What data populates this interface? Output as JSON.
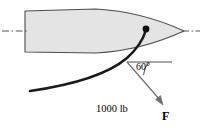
{
  "figure": {
    "name": "ship-bow-cable-force-diagram",
    "background_color": "#ffffff"
  },
  "hull": {
    "name": "ship-hull",
    "fill_color": "#e4e4e4",
    "stroke_color": "#4d4d4d",
    "path": "M 25 11 L 96 9 C 132 11 160 20 184 31 C 160 42 132 51 96 53 L 25 52 Z"
  },
  "centerline": {
    "name": "centerline",
    "style": "dash-dot",
    "stroke_color": "#555555",
    "left_segment": {
      "x1": 2,
      "y1": 31,
      "x2": 27,
      "y2": 31
    },
    "right_segment": {
      "x1": 182,
      "y1": 31,
      "x2": 200,
      "y2": 31
    }
  },
  "attachment_point": {
    "name": "cable-attachment-point",
    "x": 146,
    "y": 29,
    "radius": 3.4,
    "color": "#111111"
  },
  "cable": {
    "name": "cable",
    "stroke_color": "#1a1a1a",
    "stroke_width": 2.6,
    "path": "M 146 30 C 143 40 137 49 127 58 C 108 74 72 85 30 91"
  },
  "horizontal_reference": {
    "name": "horizontal-reference-line",
    "stroke_color": "#3a3a3a",
    "x1": 127,
    "y1": 62,
    "x2": 172,
    "y2": 62
  },
  "force_vector": {
    "name": "force-vector",
    "stroke_color": "#6e6e6e",
    "from": {
      "x": 127,
      "y": 62
    },
    "to": {
      "x": 163,
      "y": 104
    },
    "arrowhead": "M 163 105 L 156 98 L 161 96 Z"
  },
  "angle_arc": {
    "name": "angle-arc",
    "stroke_color": "#3a3a3a",
    "path": "M 150 62 A 23 23 0 0 0 144 76"
  },
  "labels": {
    "angle": "60°",
    "force_caption_line1": "1000 lb",
    "force_caption_line2": "magnitude",
    "force_caption_line3": "force",
    "force_vector_symbol": "F"
  }
}
